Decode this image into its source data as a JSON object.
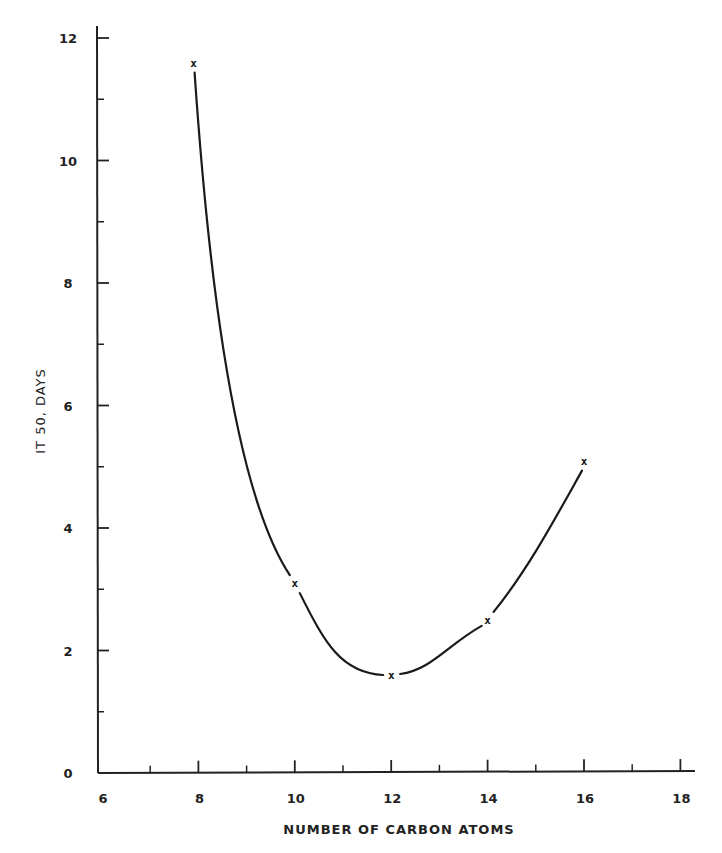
{
  "chart_data": {
    "type": "line",
    "title": "",
    "xlabel": "NUMBER OF CARBON ATOMS",
    "ylabel": "IT 50, DAYS",
    "xlim": [
      6,
      18
    ],
    "ylim": [
      0,
      12
    ],
    "x_ticks_major": [
      6,
      8,
      10,
      12,
      14,
      16,
      18
    ],
    "x_ticks_minor": [
      7,
      9,
      11,
      13,
      15,
      17
    ],
    "y_ticks_major": [
      0,
      2,
      4,
      6,
      8,
      10,
      12
    ],
    "y_ticks_minor": [
      1,
      3,
      5,
      7,
      9,
      11
    ],
    "grid": false,
    "legend": null,
    "marker": "x",
    "series": [
      {
        "name": "IT 50",
        "x": [
          7.9,
          10,
          12,
          14,
          16
        ],
        "y": [
          11.6,
          3.1,
          1.6,
          2.5,
          5.1
        ]
      }
    ],
    "curve": "smooth fitted curve through points, minimum near 12 carbon atoms"
  },
  "colors": {
    "ink": "#222222",
    "background": "#ffffff"
  }
}
